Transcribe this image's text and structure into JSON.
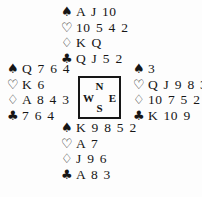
{
  "suit_symbols": {
    "spade": "♠",
    "heart": "♡",
    "diamond": "♢",
    "club": "♣"
  },
  "compass": {
    "north": "N",
    "west": "W",
    "east": "E",
    "south": "S"
  },
  "hands": {
    "north": {
      "spades": "A J 10",
      "hearts": "10 5 4 2",
      "diamonds": "K Q",
      "clubs": "Q J 5 2"
    },
    "west": {
      "spades": "Q 7 6 4",
      "hearts": "K 6",
      "diamonds": "A 8 4 3",
      "clubs": "7 6 4"
    },
    "east": {
      "spades": "3",
      "hearts": "Q J 9 8 3",
      "diamonds": "10 7 5 2",
      "clubs": "K 10 9"
    },
    "south": {
      "spades": "K 9 8 5 2",
      "hearts": "A 7",
      "diamonds": "J 9 6",
      "clubs": "A 8 3"
    }
  },
  "colors": {
    "ink": "#161616",
    "background": "#fdfdfd"
  }
}
